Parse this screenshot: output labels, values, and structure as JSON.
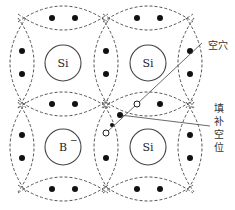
{
  "diagram": {
    "type": "crystal-lattice",
    "stroke_color": "#555555",
    "atoms": [
      {
        "id": "si-top-left",
        "label": "Si",
        "charge": "",
        "cx": 63,
        "cy": 63,
        "r": 18
      },
      {
        "id": "si-top-right",
        "label": "Si",
        "charge": "",
        "cx": 148,
        "cy": 63,
        "r": 18
      },
      {
        "id": "b-bottom-left",
        "label": "B",
        "charge": "−",
        "cx": 63,
        "cy": 147,
        "r": 18
      },
      {
        "id": "si-bottom-right",
        "label": "Si",
        "charge": "",
        "cx": 148,
        "cy": 147,
        "r": 18
      }
    ],
    "bonds_horizontal": [
      {
        "cx": 63,
        "cy": 18,
        "dots": [
          [
            52,
            18
          ],
          [
            75,
            18
          ]
        ]
      },
      {
        "cx": 148,
        "cy": 18,
        "dots": [
          [
            137,
            18
          ],
          [
            160,
            18
          ]
        ]
      },
      {
        "cx": 63,
        "cy": 104,
        "dots": [
          [
            52,
            104
          ],
          [
            75,
            104
          ]
        ]
      },
      {
        "cx": 148,
        "cy": 104,
        "dots": [
          [
            137,
            104
          ],
          [
            160,
            104
          ]
        ],
        "hole_left": true
      },
      {
        "cx": 63,
        "cy": 189,
        "dots": [
          [
            52,
            189
          ],
          [
            75,
            189
          ]
        ]
      },
      {
        "cx": 148,
        "cy": 189,
        "dots": [
          [
            137,
            189
          ],
          [
            160,
            189
          ]
        ]
      }
    ],
    "bonds_vertical": [
      {
        "cx": 22,
        "cy": 63,
        "dots": [
          [
            22,
            51
          ],
          [
            22,
            74
          ]
        ]
      },
      {
        "cx": 106,
        "cy": 63,
        "dots": [
          [
            106,
            51
          ],
          [
            106,
            74
          ]
        ]
      },
      {
        "cx": 190,
        "cy": 63,
        "dots": [
          [
            190,
            51
          ],
          [
            190,
            74
          ]
        ]
      },
      {
        "cx": 22,
        "cy": 147,
        "dots": [
          [
            22,
            135
          ],
          [
            22,
            158
          ]
        ]
      },
      {
        "cx": 106,
        "cy": 147,
        "dots": [
          [
            106,
            158
          ]
        ],
        "hole_top": true
      },
      {
        "cx": 190,
        "cy": 147,
        "dots": [
          [
            190,
            135
          ],
          [
            190,
            158
          ]
        ]
      }
    ],
    "hole_markers": {
      "upper_hole": {
        "cx": 137,
        "cy": 104
      },
      "filled_electron": {
        "cx": 120,
        "cy": 115
      },
      "lower_hole": {
        "cx": 106,
        "cy": 133
      },
      "moving_electron": {
        "cx": 112,
        "cy": 125
      }
    },
    "annotations": {
      "hole_label": "空穴",
      "fill_label_chars": [
        "填",
        "补",
        "空",
        "位"
      ],
      "fill_label": "填补空位"
    }
  }
}
